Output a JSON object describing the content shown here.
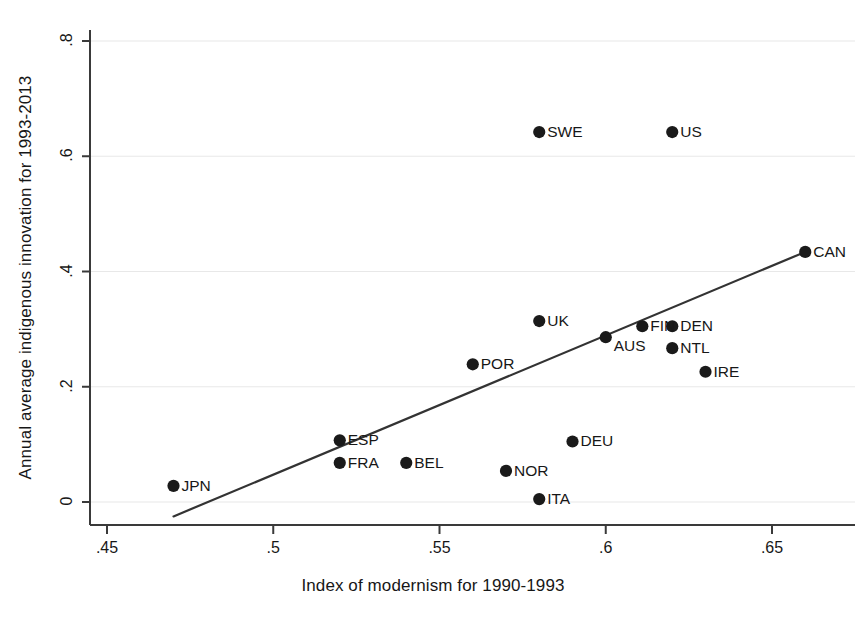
{
  "chart_data": {
    "type": "scatter",
    "title": "",
    "xlabel": "Index of modernism for 1990-1993",
    "ylabel": "Annual average indigenous innovation for 1993-2013",
    "xlim": [
      0.45,
      0.665
    ],
    "ylim": [
      -0.03,
      0.82
    ],
    "xticks": [
      0.45,
      0.5,
      0.55,
      0.6,
      0.65
    ],
    "xtick_labels": [
      ".45",
      ".5",
      ".55",
      ".6",
      ".65"
    ],
    "yticks": [
      0,
      0.2,
      0.4,
      0.6,
      0.8
    ],
    "ytick_labels": [
      "0",
      ".2",
      ".4",
      ".6",
      ".8"
    ],
    "grid": "horizontal",
    "grid_color": "#e8e8e8",
    "marker_color": "#1a1a1a",
    "marker_size": 9,
    "legend": "none",
    "points": [
      {
        "label": "JPN",
        "x": 0.47,
        "y": 0.028,
        "label_side": "right"
      },
      {
        "label": "ESP",
        "x": 0.52,
        "y": 0.107,
        "label_side": "right"
      },
      {
        "label": "FRA",
        "x": 0.52,
        "y": 0.068,
        "label_side": "right"
      },
      {
        "label": "BEL",
        "x": 0.54,
        "y": 0.068,
        "label_side": "right"
      },
      {
        "label": "NOR",
        "x": 0.57,
        "y": 0.054,
        "label_side": "right"
      },
      {
        "label": "ITA",
        "x": 0.58,
        "y": 0.005,
        "label_side": "right"
      },
      {
        "label": "POR",
        "x": 0.56,
        "y": 0.239,
        "label_side": "right"
      },
      {
        "label": "UK",
        "x": 0.58,
        "y": 0.314,
        "label_side": "right"
      },
      {
        "label": "SWE",
        "x": 0.58,
        "y": 0.642,
        "label_side": "right"
      },
      {
        "label": "DEU",
        "x": 0.59,
        "y": 0.105,
        "label_side": "right"
      },
      {
        "label": "AUS",
        "x": 0.6,
        "y": 0.286,
        "label_side": "right-below"
      },
      {
        "label": "FIN",
        "x": 0.611,
        "y": 0.305,
        "label_side": "right"
      },
      {
        "label": "DEN",
        "x": 0.62,
        "y": 0.305,
        "label_side": "right"
      },
      {
        "label": "US",
        "x": 0.62,
        "y": 0.642,
        "label_side": "right"
      },
      {
        "label": "NTL",
        "x": 0.62,
        "y": 0.267,
        "label_side": "right"
      },
      {
        "label": "IRE",
        "x": 0.63,
        "y": 0.226,
        "label_side": "right"
      },
      {
        "label": "CAN",
        "x": 0.66,
        "y": 0.434,
        "label_side": "right"
      }
    ],
    "fit_line": {
      "type": "linear",
      "x_start": 0.47,
      "y_start": -0.025,
      "x_end": 0.66,
      "y_end": 0.434,
      "color": "#333333",
      "width": 2.2
    }
  }
}
